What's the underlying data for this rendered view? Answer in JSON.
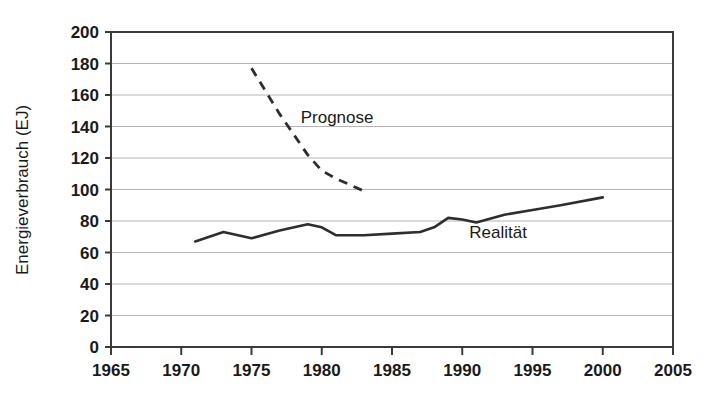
{
  "chart_data": {
    "type": "line",
    "title": "",
    "subtitle": "",
    "xlabel": "",
    "ylabel": "Energieverbrauch (EJ)",
    "xlim": [
      1965,
      2005
    ],
    "ylim": [
      0,
      200
    ],
    "grid": "horizontal",
    "legend_position": "inline-annotation",
    "xticks": [
      1965,
      1970,
      1975,
      1980,
      1985,
      1990,
      1995,
      2000,
      2005
    ],
    "yticks": [
      0,
      20,
      40,
      60,
      80,
      100,
      120,
      140,
      160,
      180,
      200
    ],
    "xtick_labels": [
      "1965",
      "1970",
      "1975",
      "1980",
      "1985",
      "1990",
      "1995",
      "2000",
      "2005"
    ],
    "ytick_labels": [
      "0",
      "20",
      "40",
      "60",
      "80",
      "100",
      "120",
      "140",
      "160",
      "180",
      "200"
    ],
    "series": [
      {
        "name": "Prognose",
        "style": "dashed",
        "color": "#2e2e2e",
        "annotation": "Prognose",
        "annotation_x": 1978.5,
        "annotation_y": 142,
        "x": [
          1975,
          1977,
          1979,
          1980,
          1981,
          1983
        ],
        "values": [
          177,
          148,
          122,
          112,
          107,
          99
        ]
      },
      {
        "name": "Realität",
        "style": "solid",
        "color": "#2e2e2e",
        "annotation": "Realität",
        "annotation_x": 1990.5,
        "annotation_y": 69,
        "x": [
          1971,
          1973,
          1975,
          1977,
          1979,
          1980,
          1981,
          1983,
          1985,
          1987,
          1988,
          1989,
          1990,
          1991,
          1993,
          1995,
          1997,
          2000
        ],
        "values": [
          67,
          73,
          69,
          74,
          78,
          76,
          71,
          71,
          72,
          73,
          76,
          82,
          81,
          79,
          84,
          87,
          90,
          95
        ]
      }
    ]
  }
}
